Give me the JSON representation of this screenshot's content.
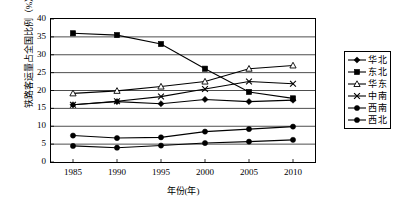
{
  "chart_data": {
    "type": "line",
    "title": "",
    "xlabel": "年份(年)",
    "ylabel": "铁路客运量占全国比例（%）",
    "categories": [
      "1985",
      "1990",
      "1995",
      "2000",
      "2005",
      "2010"
    ],
    "x": [
      1985,
      1990,
      1995,
      2000,
      2005,
      2010
    ],
    "xlim": [
      1982.5,
      2012.5
    ],
    "ylim": [
      0,
      40
    ],
    "yticks": [
      0,
      5,
      10,
      15,
      20,
      25,
      30,
      35,
      40
    ],
    "grid": true,
    "grid_axis": "y",
    "legend_position": "right-outside",
    "series": [
      {
        "name": "华北",
        "marker": "filled-diamond",
        "values": [
          16.0,
          16.9,
          16.3,
          17.5,
          16.9,
          17.3
        ]
      },
      {
        "name": "东北",
        "marker": "filled-square",
        "values": [
          36.0,
          35.5,
          33.0,
          26.1,
          19.6,
          17.8
        ]
      },
      {
        "name": "华东",
        "marker": "open-triangle",
        "values": [
          19.2,
          19.9,
          21.1,
          22.5,
          26.1,
          27.0
        ]
      },
      {
        "name": "中南",
        "marker": "cross-x",
        "values": [
          16.0,
          17.0,
          18.3,
          20.4,
          22.5,
          21.9
        ]
      },
      {
        "name": "西南",
        "marker": "filled-circle",
        "values": [
          7.4,
          6.7,
          6.9,
          8.5,
          9.2,
          9.9
        ]
      },
      {
        "name": "西北",
        "marker": "filled-circle",
        "values": [
          4.5,
          4.0,
          4.6,
          5.3,
          5.7,
          6.2
        ]
      }
    ],
    "series_color": "#000000",
    "background_color": "#ffffff",
    "frame_color": "#000000"
  },
  "axes": {
    "y_tick_labels": [
      "40",
      "35",
      "30",
      "25",
      "20",
      "15",
      "10",
      "5",
      "0"
    ],
    "x_tick_labels": [
      "1985",
      "1990",
      "1995",
      "2000",
      "2005",
      "2010"
    ]
  },
  "legend": {
    "items": [
      {
        "label": "华北"
      },
      {
        "label": "东北"
      },
      {
        "label": "华东"
      },
      {
        "label": "中南"
      },
      {
        "label": "西南"
      },
      {
        "label": "西北"
      }
    ]
  }
}
